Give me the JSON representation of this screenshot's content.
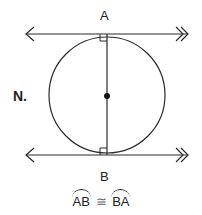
{
  "figure": {
    "label": "N.",
    "points": {
      "top": "A",
      "bottom": "B"
    },
    "statement": {
      "arc1": "AB",
      "symbol": "≅",
      "arc2": "BA"
    },
    "colors": {
      "stroke": "#2b2b2b",
      "background": "#ffffff"
    }
  }
}
